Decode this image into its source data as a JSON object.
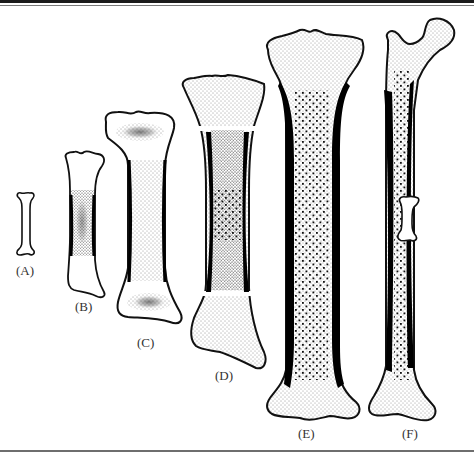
{
  "figure": {
    "colors": {
      "outline": "#111111",
      "cortex": "#000000",
      "stipple": "#222222",
      "background": "#ffffff",
      "rule": "#6e6e6e"
    },
    "stages": [
      {
        "id": "A",
        "label": "(A)",
        "description": "cartilage model"
      },
      {
        "id": "B",
        "label": "(B)",
        "description": "primary ossification center in diaphysis"
      },
      {
        "id": "C",
        "label": "(C)",
        "description": "secondary ossification centers in epiphyses"
      },
      {
        "id": "D",
        "label": "(D)",
        "description": "epiphyseal plates with marrow cavity"
      },
      {
        "id": "E",
        "label": "(E)",
        "description": "mature long bone with compact cortex"
      },
      {
        "id": "F",
        "label": "(F)",
        "description": "adult femur with stage A outline overlaid for scale"
      }
    ]
  }
}
